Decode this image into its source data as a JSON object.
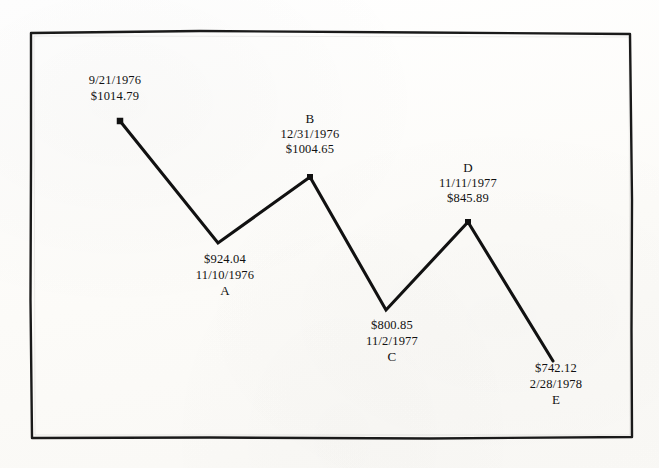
{
  "chart_data": {
    "type": "line",
    "title": "",
    "subtitle": "",
    "xlabel": "",
    "ylabel": "",
    "grid": false,
    "legend": false,
    "x": [
      "9/21/1976",
      "11/10/1976",
      "12/31/1976",
      "11/2/1977",
      "11/11/1977",
      "2/28/1978"
    ],
    "values": [
      1014.79,
      924.04,
      1004.65,
      800.85,
      845.89,
      742.12
    ],
    "ylim": [
      700,
      1050
    ],
    "point_labels": [
      "",
      "A",
      "B",
      "C",
      "D",
      "E"
    ],
    "series": [
      {
        "name": "",
        "values": [
          1014.79,
          924.04,
          1004.65,
          800.85,
          845.89,
          742.12
        ]
      }
    ],
    "points": [
      {
        "letter": "",
        "date": "9/21/1976",
        "price": "$1014.79",
        "value": 1014.79,
        "x": 120,
        "y": 121
      },
      {
        "letter": "A",
        "date": "11/10/1976",
        "price": "$924.04",
        "value": 924.04,
        "x": 218,
        "y": 243
      },
      {
        "letter": "B",
        "date": "12/31/1976",
        "price": "$1004.65",
        "value": 1004.65,
        "x": 310,
        "y": 177
      },
      {
        "letter": "C",
        "date": "11/2/1977",
        "price": "$800.85",
        "value": 800.85,
        "x": 386,
        "y": 310
      },
      {
        "letter": "D",
        "date": "11/11/1977",
        "price": "$845.89",
        "value": 845.89,
        "x": 468,
        "y": 222
      },
      {
        "letter": "E",
        "date": "2/28/1978",
        "price": "$742.12",
        "value": 742.12,
        "x": 553,
        "y": 361
      }
    ],
    "colors": {
      "line": "#111111",
      "marker": "#111111",
      "frame": "#1a1a1a",
      "background": "#fdfdfb",
      "text": "#111111"
    }
  },
  "annotations": {
    "start_point": {
      "line1": "9/21/1976",
      "line2": "$1014.79"
    },
    "point_a": {
      "line1": "$924.04",
      "line2": "11/10/1976",
      "line3": "A"
    },
    "point_b": {
      "line1": "B",
      "line2": "12/31/1976",
      "line3": "$1004.65"
    },
    "point_c": {
      "line1": "$800.85",
      "line2": "11/2/1977",
      "line3": "C"
    },
    "point_d": {
      "line1": "D",
      "line2": "11/11/1977",
      "line3": "$845.89"
    },
    "point_e": {
      "line1": "$742.12",
      "line2": "2/28/1978",
      "line3": "E"
    }
  }
}
